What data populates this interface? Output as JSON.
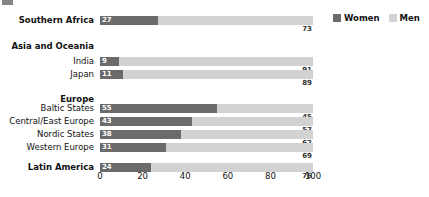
{
  "chart_data": {
    "type": "bar",
    "subtype": "stacked-horizontal-100pct",
    "title": "",
    "xlabel": "",
    "ylabel": "",
    "xlim": [
      0,
      100
    ],
    "xticks": [
      "0",
      "20",
      "40",
      "60",
      "80",
      "100"
    ],
    "grid": false,
    "legend_position": "top-right",
    "categories": [
      "Southern Africa",
      "India",
      "Japan",
      "Baltic States",
      "Central/East Europe",
      "Nordic States",
      "Western Europe",
      "Latin America"
    ],
    "series": [
      {
        "name": "Women",
        "color": "#6b6b6b",
        "values": [
          27,
          9,
          11,
          55,
          43,
          38,
          31,
          24
        ]
      },
      {
        "name": "Men",
        "color": "#d2d2d2",
        "values": [
          73,
          91,
          89,
          45,
          57,
          62,
          69,
          76
        ]
      }
    ]
  },
  "legend": {
    "entries": [
      {
        "label": "Women",
        "color": "#6b6b6b"
      },
      {
        "label": "Men",
        "color": "#d2d2d2"
      }
    ]
  },
  "rows": [
    {
      "label": "Southern Africa",
      "is_group": true,
      "has_bar": true,
      "women": 27,
      "men": 73
    },
    {
      "label": "Asia and Oceania",
      "is_group": true,
      "has_bar": false
    },
    {
      "label": "India",
      "is_group": false,
      "has_bar": true,
      "women": 9,
      "men": 91
    },
    {
      "label": "Japan",
      "is_group": false,
      "has_bar": true,
      "women": 11,
      "men": 89
    },
    {
      "label": "Europe",
      "is_group": true,
      "has_bar": false
    },
    {
      "label": "Baltic States",
      "is_group": false,
      "has_bar": true,
      "women": 55,
      "men": 45
    },
    {
      "label": "Central/East Europe",
      "is_group": false,
      "has_bar": true,
      "women": 43,
      "men": 57
    },
    {
      "label": "Nordic States",
      "is_group": false,
      "has_bar": true,
      "women": 38,
      "men": 62
    },
    {
      "label": "Western Europe",
      "is_group": false,
      "has_bar": true,
      "women": 31,
      "men": 69
    },
    {
      "label": "Latin America",
      "is_group": true,
      "has_bar": true,
      "women": 24,
      "men": 76
    }
  ],
  "axis": {
    "ticks": [
      "0",
      "20",
      "40",
      "60",
      "80",
      "100"
    ]
  },
  "colors": {
    "women": "#6b6b6b",
    "men": "#d2d2d2",
    "text": "#111111",
    "background": "#ffffff"
  }
}
